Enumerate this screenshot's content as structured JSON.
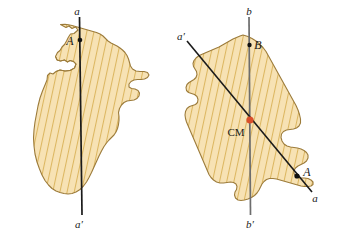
{
  "figure": {
    "title": "",
    "background_color": "#ffffff",
    "shape_fill_color": "#f5deac",
    "shape_hatch_color": "#d8b45f",
    "shape_outline_color": "#9c7b3a",
    "axis_line_color_left": "#1a1a1a",
    "axis_line_color_vertical_right": "#6d6d6d",
    "axis_line_color_diagonal_right": "#1a1a1a",
    "point_marker_color": "#111111",
    "cm_marker_color": "#d94f2b",
    "panels": [
      {
        "id": "left-panel",
        "name": "left-figure-single-axis",
        "line_labels": {
          "top": "a",
          "bottom": "a′"
        },
        "points": [
          {
            "label": "A",
            "name": "point-a"
          }
        ]
      },
      {
        "id": "right-panel",
        "name": "right-figure-two-axes",
        "line_labels": {
          "vertical_top": "b",
          "vertical_bottom": "b′",
          "diagonal_top": "a′",
          "diagonal_bottom": "a"
        },
        "points": [
          {
            "label": "B",
            "name": "point-b"
          },
          {
            "label": "A",
            "name": "point-a"
          },
          {
            "label": "CM",
            "name": "center-of-mass-label"
          }
        ]
      }
    ]
  }
}
